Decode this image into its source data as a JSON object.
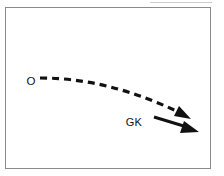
{
  "figure": {
    "title": "",
    "background_color": "#ffffff",
    "frame": {
      "name": "figure-border",
      "stroke_color": "#8a8a8a",
      "stroke_width": 1,
      "x": 5.5,
      "y": 7.5,
      "width": 205,
      "height": 161
    },
    "top_rule": {
      "name": "top-hairline",
      "stroke_color": "#cccccc",
      "x1": 150,
      "y1": 2.5,
      "x2": 212,
      "y2": 2.5
    },
    "labels": [
      {
        "id": "origin",
        "text": "O",
        "x": 31,
        "y": 82,
        "color": "#111111"
      },
      {
        "id": "gk",
        "text": "GK",
        "x": 134,
        "y": 123,
        "color": "#111111"
      }
    ],
    "trajectory": {
      "name": "dashed-trajectory-curve",
      "style": "dashed",
      "stroke_color": "#111111",
      "stroke_width": 3.2,
      "dash_pattern": "7 5",
      "start": [
        40,
        78
      ],
      "control1": [
        95,
        78
      ],
      "control2": [
        140,
        94
      ],
      "end": [
        181,
        113
      ],
      "arrowhead": {
        "name": "trajectory-arrowhead",
        "tip": [
          190,
          118
        ],
        "color": "#111111"
      }
    },
    "force_vector": {
      "name": "gk-force-arrow",
      "style": "solid",
      "stroke_color": "#111111",
      "stroke_width": 3.0,
      "start": [
        154,
        117
      ],
      "end": [
        188,
        128
      ],
      "arrowhead": {
        "name": "gk-arrowhead",
        "tip": [
          198,
          131
        ],
        "color": "#111111"
      }
    }
  }
}
